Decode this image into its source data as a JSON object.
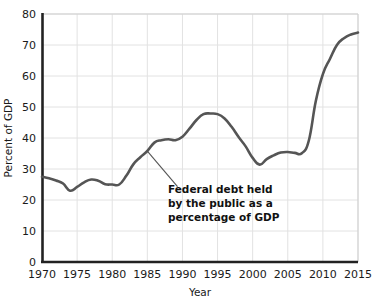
{
  "chart_data": {
    "type": "line",
    "title": "",
    "xlabel": "Year",
    "ylabel": "Percent of GDP",
    "xlim": [
      1970,
      2015
    ],
    "ylim": [
      0,
      80
    ],
    "grid": true,
    "legend": "none",
    "line_color": "#555555",
    "grid_color": "#e2e2e2",
    "axis_color": "#222222",
    "x_ticks": [
      1970,
      1975,
      1980,
      1985,
      1990,
      1995,
      2000,
      2005,
      2010,
      2015
    ],
    "y_ticks": [
      0,
      10,
      20,
      30,
      40,
      50,
      60,
      70,
      80
    ],
    "x_tick_labels": [
      "1970",
      "1975",
      "1980",
      "1985",
      "1990",
      "1995",
      "2000",
      "2005",
      "2010",
      "2015"
    ],
    "y_tick_labels": [
      "0",
      "10",
      "20",
      "30",
      "40",
      "50",
      "60",
      "70",
      "80"
    ],
    "series": [
      {
        "name": "Federal debt held by the public as a percentage of GDP",
        "x": [
          1970,
          1971,
          1972,
          1973,
          1974,
          1975,
          1976,
          1977,
          1978,
          1979,
          1980,
          1981,
          1982,
          1983,
          1984,
          1985,
          1986,
          1987,
          1988,
          1989,
          1990,
          1991,
          1992,
          1993,
          1994,
          1995,
          1996,
          1997,
          1998,
          1999,
          2000,
          2001,
          2002,
          2003,
          2004,
          2005,
          2006,
          2007,
          2008,
          2009,
          2010,
          2011,
          2012,
          2013,
          2014,
          2015
        ],
        "values": [
          27.5,
          27.0,
          26.3,
          25.3,
          23.0,
          24.2,
          25.7,
          26.6,
          26.2,
          25.1,
          25.0,
          25.0,
          27.8,
          31.5,
          33.8,
          35.8,
          38.5,
          39.3,
          39.6,
          39.3,
          40.4,
          43.0,
          45.8,
          47.7,
          47.9,
          47.7,
          46.3,
          43.6,
          40.3,
          37.3,
          33.6,
          31.4,
          33.2,
          34.4,
          35.3,
          35.5,
          35.2,
          35.1,
          39.2,
          52.0,
          60.6,
          65.5,
          70.0,
          72.2,
          73.4,
          74.0
        ]
      }
    ],
    "annotation": {
      "lines": [
        "Federal debt held",
        "by the public as a",
        "percentage of GDP"
      ],
      "leader_from": {
        "x": 1985.0,
        "y": 35.8
      },
      "leader_to": {
        "x": 1989.3,
        "y": 24.3
      }
    }
  }
}
